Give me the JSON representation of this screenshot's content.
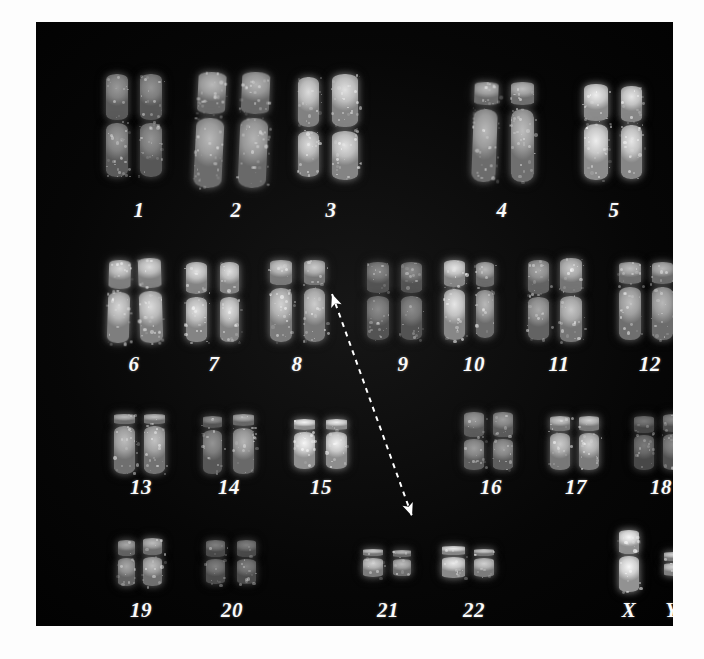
{
  "image": {
    "type": "karyotype-photomicrograph",
    "background_color": "#030303",
    "label_color": "#fbfbfb",
    "plate": {
      "x": 36,
      "y": 22,
      "width": 637,
      "height": 604
    }
  },
  "annotation": {
    "kind": "double-headed-dashed-arrow",
    "from_label": "9",
    "to_label": "22",
    "color": "#ffffff",
    "dash": "5 5",
    "start": {
      "x": 296,
      "y": 272
    },
    "end": {
      "x": 376,
      "y": 494
    }
  },
  "rows": [
    {
      "name": "row-1",
      "label_y": 176,
      "groups": [
        {
          "label": "1",
          "label_x": 103,
          "pair": [
            {
              "x": 70,
              "y": 52,
              "w": 22,
              "h": 103,
              "cen": 0.46,
              "bright": 0.6,
              "bow": 0
            },
            {
              "x": 104,
              "y": 52,
              "w": 22,
              "h": 103,
              "cen": 0.46,
              "bright": 0.58,
              "bow": 0
            }
          ]
        },
        {
          "label": "2",
          "label_x": 200,
          "pair": [
            {
              "x": 160,
              "y": 50,
              "w": 28,
              "h": 116,
              "cen": 0.38,
              "bright": 0.72,
              "bow": 8
            },
            {
              "x": 204,
              "y": 50,
              "w": 28,
              "h": 116,
              "cen": 0.38,
              "bright": 0.7,
              "bow": 7
            }
          ]
        },
        {
          "label": "3",
          "label_x": 295,
          "pair": [
            {
              "x": 262,
              "y": 55,
              "w": 21,
              "h": 100,
              "cen": 0.52,
              "bright": 0.86,
              "bow": 0
            },
            {
              "x": 296,
              "y": 52,
              "w": 26,
              "h": 106,
              "cen": 0.52,
              "bright": 0.88,
              "bow": 0
            }
          ]
        },
        {
          "label": "4",
          "label_x": 466,
          "pair": [
            {
              "x": 437,
              "y": 60,
              "w": 24,
              "h": 100,
              "cen": 0.25,
              "bright": 0.72,
              "bow": 6
            },
            {
              "x": 475,
              "y": 60,
              "w": 23,
              "h": 100,
              "cen": 0.25,
              "bright": 0.74,
              "bow": 0
            }
          ]
        },
        {
          "label": "5",
          "label_x": 578,
          "pair": [
            {
              "x": 548,
              "y": 62,
              "w": 24,
              "h": 96,
              "cen": 0.4,
              "bright": 0.93,
              "bow": 0
            },
            {
              "x": 585,
              "y": 64,
              "w": 21,
              "h": 93,
              "cen": 0.4,
              "bright": 0.9,
              "bow": 0
            }
          ]
        }
      ]
    },
    {
      "name": "row-2",
      "label_y": 330,
      "groups": [
        {
          "label": "6",
          "label_x": 98,
          "pair": [
            {
              "x": 72,
              "y": 238,
              "w": 22,
              "h": 83,
              "cen": 0.37,
              "bright": 0.84,
              "bow": 5
            },
            {
              "x": 103,
              "y": 236,
              "w": 23,
              "h": 85,
              "cen": 0.37,
              "bright": 0.86,
              "bow": -5
            }
          ]
        },
        {
          "label": "7",
          "label_x": 178,
          "pair": [
            {
              "x": 150,
              "y": 240,
              "w": 21,
              "h": 80,
              "cen": 0.42,
              "bright": 0.88,
              "bow": 0
            },
            {
              "x": 184,
              "y": 240,
              "w": 19,
              "h": 80,
              "cen": 0.42,
              "bright": 0.88,
              "bow": 0
            }
          ]
        },
        {
          "label": "8",
          "label_x": 261,
          "pair": [
            {
              "x": 234,
              "y": 238,
              "w": 22,
              "h": 82,
              "cen": 0.32,
              "bright": 0.82,
              "bow": 0
            },
            {
              "x": 268,
              "y": 238,
              "w": 21,
              "h": 82,
              "cen": 0.32,
              "bright": 0.8,
              "bow": 0
            }
          ]
        },
        {
          "label": "9",
          "label_x": 367,
          "pair": [
            {
              "x": 331,
              "y": 240,
              "w": 22,
              "h": 78,
              "cen": 0.42,
              "bright": 0.55,
              "bow": 0
            },
            {
              "x": 365,
              "y": 240,
              "w": 21,
              "h": 78,
              "cen": 0.42,
              "bright": 0.55,
              "bow": 0
            }
          ]
        },
        {
          "label": "10",
          "label_x": 438,
          "pair": [
            {
              "x": 408,
              "y": 238,
              "w": 21,
              "h": 80,
              "cen": 0.35,
              "bright": 0.9,
              "bow": 0
            },
            {
              "x": 440,
              "y": 240,
              "w": 18,
              "h": 76,
              "cen": 0.35,
              "bright": 0.72,
              "bow": 0
            }
          ]
        },
        {
          "label": "11",
          "label_x": 523,
          "pair": [
            {
              "x": 492,
              "y": 238,
              "w": 21,
              "h": 80,
              "cen": 0.44,
              "bright": 0.66,
              "bow": 0
            },
            {
              "x": 524,
              "y": 236,
              "w": 22,
              "h": 84,
              "cen": 0.44,
              "bright": 0.78,
              "bow": 0
            }
          ]
        },
        {
          "label": "12",
          "label_x": 614,
          "pair": [
            {
              "x": 583,
              "y": 240,
              "w": 22,
              "h": 78,
              "cen": 0.3,
              "bright": 0.74,
              "bow": 0
            },
            {
              "x": 616,
              "y": 240,
              "w": 21,
              "h": 78,
              "cen": 0.3,
              "bright": 0.72,
              "bow": 0
            }
          ]
        }
      ]
    },
    {
      "name": "row-3",
      "label_y": 453,
      "groups": [
        {
          "label": "13",
          "label_x": 105,
          "pair": [
            {
              "x": 78,
              "y": 392,
              "w": 21,
              "h": 60,
              "cen": 0.18,
              "bright": 0.74,
              "bow": 0
            },
            {
              "x": 108,
              "y": 392,
              "w": 21,
              "h": 60,
              "cen": 0.18,
              "bright": 0.76,
              "bow": 0
            }
          ]
        },
        {
          "label": "14",
          "label_x": 193,
          "pair": [
            {
              "x": 167,
              "y": 394,
              "w": 19,
              "h": 58,
              "cen": 0.22,
              "bright": 0.58,
              "bow": 0
            },
            {
              "x": 197,
              "y": 392,
              "w": 21,
              "h": 60,
              "cen": 0.22,
              "bright": 0.7,
              "bow": 0
            }
          ]
        },
        {
          "label": "15",
          "label_x": 285,
          "pair": [
            {
              "x": 258,
              "y": 397,
              "w": 21,
              "h": 50,
              "cen": 0.24,
              "bright": 0.96,
              "bow": 0
            },
            {
              "x": 290,
              "y": 397,
              "w": 21,
              "h": 50,
              "cen": 0.24,
              "bright": 0.94,
              "bow": 0
            }
          ]
        },
        {
          "label": "16",
          "label_x": 455,
          "pair": [
            {
              "x": 428,
              "y": 390,
              "w": 20,
              "h": 58,
              "cen": 0.44,
              "bright": 0.62,
              "bow": 0
            },
            {
              "x": 457,
              "y": 390,
              "w": 20,
              "h": 58,
              "cen": 0.44,
              "bright": 0.62,
              "bow": 0
            }
          ]
        },
        {
          "label": "17",
          "label_x": 540,
          "pair": [
            {
              "x": 514,
              "y": 394,
              "w": 20,
              "h": 54,
              "cen": 0.3,
              "bright": 0.8,
              "bow": 0
            },
            {
              "x": 543,
              "y": 394,
              "w": 20,
              "h": 54,
              "cen": 0.3,
              "bright": 0.82,
              "bow": 0
            }
          ]
        },
        {
          "label": "18",
          "label_x": 625,
          "pair": [
            {
              "x": 598,
              "y": 394,
              "w": 20,
              "h": 54,
              "cen": 0.34,
              "bright": 0.48,
              "bow": 0
            },
            {
              "x": 627,
              "y": 392,
              "w": 20,
              "h": 56,
              "cen": 0.34,
              "bright": 0.54,
              "bow": 0
            }
          ]
        }
      ]
    },
    {
      "name": "row-4",
      "label_y": 576,
      "groups": [
        {
          "label": "19",
          "label_x": 105,
          "pair": [
            {
              "x": 82,
              "y": 518,
              "w": 17,
              "h": 46,
              "cen": 0.38,
              "bright": 0.66,
              "bow": 0
            },
            {
              "x": 107,
              "y": 516,
              "w": 19,
              "h": 48,
              "cen": 0.38,
              "bright": 0.74,
              "bow": 0
            }
          ]
        },
        {
          "label": "20",
          "label_x": 196,
          "pair": [
            {
              "x": 170,
              "y": 518,
              "w": 19,
              "h": 44,
              "cen": 0.4,
              "bright": 0.5,
              "bow": 0
            },
            {
              "x": 201,
              "y": 518,
              "w": 19,
              "h": 44,
              "cen": 0.4,
              "bright": 0.5,
              "bow": 0
            }
          ]
        },
        {
          "label": "21",
          "label_x": 352,
          "pair": [
            {
              "x": 327,
              "y": 527,
              "w": 20,
              "h": 28,
              "cen": 0.3,
              "bright": 0.82,
              "bow": 0
            },
            {
              "x": 357,
              "y": 528,
              "w": 18,
              "h": 26,
              "cen": 0.3,
              "bright": 0.74,
              "bow": 0
            }
          ]
        },
        {
          "label": "22",
          "label_x": 438,
          "pair": [
            {
              "x": 406,
              "y": 524,
              "w": 23,
              "h": 32,
              "cen": 0.3,
              "bright": 0.92,
              "bow": 0
            },
            {
              "x": 438,
              "y": 527,
              "w": 20,
              "h": 28,
              "cen": 0.3,
              "bright": 0.82,
              "bow": 0
            }
          ]
        },
        {
          "label": "X",
          "label_x": 593,
          "pair": [
            {
              "x": 583,
              "y": 508,
              "w": 20,
              "h": 62,
              "cen": 0.4,
              "bright": 0.97,
              "bow": 0
            }
          ]
        },
        {
          "label": "Y",
          "label_x": 636,
          "pair": [
            {
              "x": 628,
              "y": 530,
              "w": 19,
              "h": 24,
              "cen": 0.4,
              "bright": 0.84,
              "bow": 0
            }
          ]
        }
      ]
    }
  ]
}
